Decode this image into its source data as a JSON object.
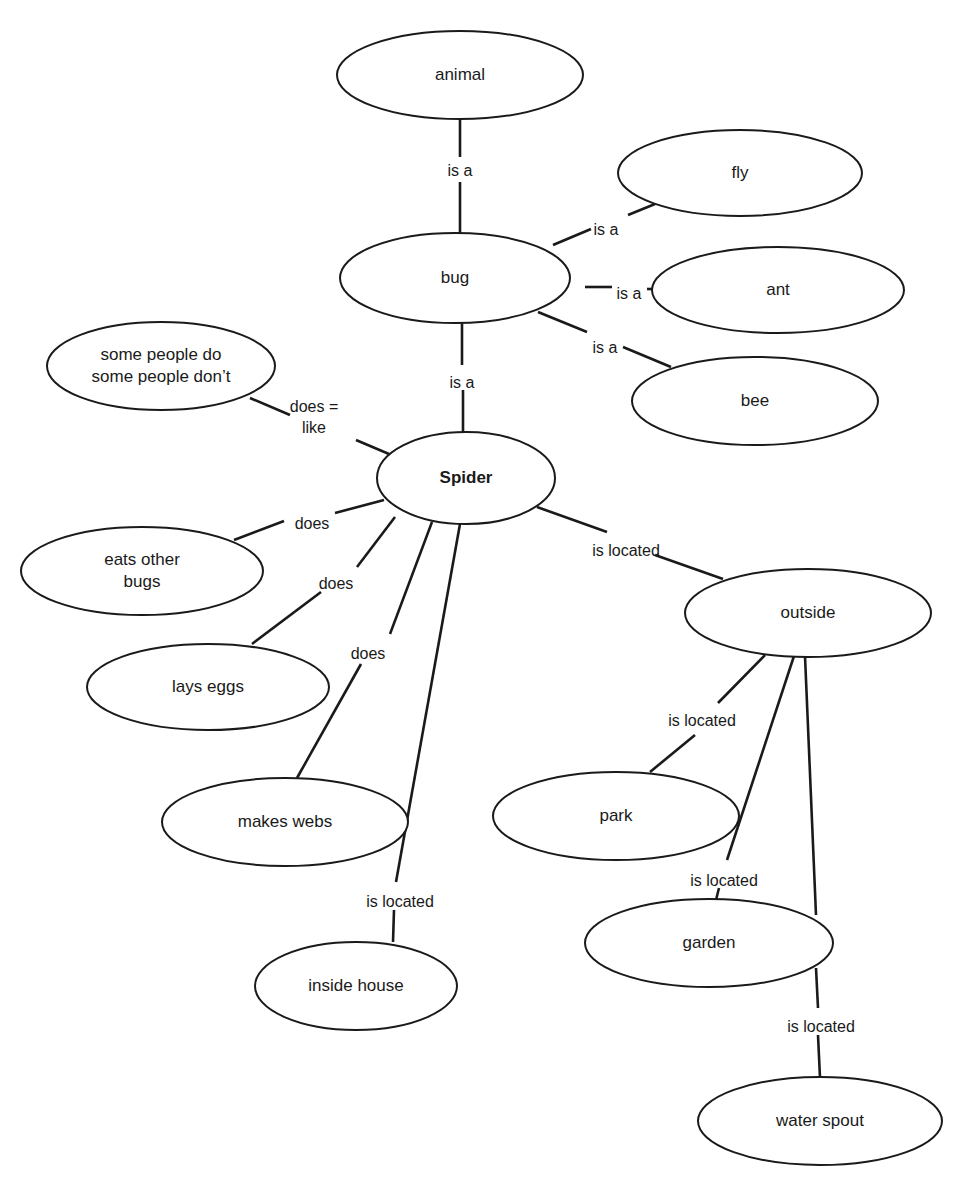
{
  "diagram": {
    "type": "concept-map",
    "colors": {
      "stroke": "#1a1a1a",
      "background": "#ffffff"
    },
    "nodes": [
      {
        "id": "animal",
        "label": [
          "animal"
        ],
        "cx": 460,
        "cy": 75,
        "rx": 123,
        "ry": 44
      },
      {
        "id": "fly",
        "label": [
          "fly"
        ],
        "cx": 740,
        "cy": 173,
        "rx": 122,
        "ry": 43
      },
      {
        "id": "bug",
        "label": [
          "bug"
        ],
        "cx": 455,
        "cy": 278,
        "rx": 115,
        "ry": 45
      },
      {
        "id": "ant",
        "label": [
          "ant"
        ],
        "cx": 778,
        "cy": 290,
        "rx": 126,
        "ry": 43
      },
      {
        "id": "bee",
        "label": [
          "bee"
        ],
        "cx": 755,
        "cy": 401,
        "rx": 123,
        "ry": 44
      },
      {
        "id": "some-people",
        "label": [
          "some people do",
          "some people don’t"
        ],
        "cx": 161,
        "cy": 366,
        "rx": 114,
        "ry": 44
      },
      {
        "id": "spider",
        "label": [
          "Spider"
        ],
        "bold": true,
        "cx": 466,
        "cy": 478,
        "rx": 89,
        "ry": 46
      },
      {
        "id": "eats-other-bugs",
        "label": [
          "eats other",
          "bugs"
        ],
        "cx": 142,
        "cy": 571,
        "rx": 121,
        "ry": 44
      },
      {
        "id": "outside",
        "label": [
          "outside"
        ],
        "cx": 808,
        "cy": 613,
        "rx": 123,
        "ry": 44
      },
      {
        "id": "lays-eggs",
        "label": [
          "lays eggs"
        ],
        "cx": 208,
        "cy": 687,
        "rx": 121,
        "ry": 43
      },
      {
        "id": "park",
        "label": [
          "park"
        ],
        "cx": 616,
        "cy": 816,
        "rx": 123,
        "ry": 44
      },
      {
        "id": "makes-webs",
        "label": [
          "makes webs"
        ],
        "cx": 285,
        "cy": 822,
        "rx": 123,
        "ry": 44
      },
      {
        "id": "garden",
        "label": [
          "garden"
        ],
        "cx": 709,
        "cy": 943,
        "rx": 124,
        "ry": 44
      },
      {
        "id": "inside-house",
        "label": [
          "inside house"
        ],
        "cx": 356,
        "cy": 986,
        "rx": 101,
        "ry": 44
      },
      {
        "id": "water-spout",
        "label": [
          "water spout"
        ],
        "cx": 820,
        "cy": 1121,
        "rx": 122,
        "ry": 44
      }
    ],
    "edges": [
      {
        "from": "animal",
        "to": "bug",
        "label": [
          "is a"
        ],
        "lx": 460,
        "ly": 172,
        "segs": [
          [
            460,
            119,
            460,
            157
          ],
          [
            460,
            182,
            460,
            233
          ]
        ]
      },
      {
        "from": "bug",
        "to": "fly",
        "label": [
          "is a"
        ],
        "lx": 606,
        "ly": 231,
        "segs": [
          [
            553,
            245,
            591,
            229
          ],
          [
            628,
            215,
            655,
            204
          ]
        ]
      },
      {
        "from": "bug",
        "to": "ant",
        "label": [
          "is a"
        ],
        "lx": 629,
        "ly": 295,
        "segs": [
          [
            585,
            287,
            612,
            287
          ],
          [
            647,
            289,
            674,
            289
          ]
        ]
      },
      {
        "from": "bug",
        "to": "bee",
        "label": [
          "is a"
        ],
        "lx": 605,
        "ly": 349,
        "segs": [
          [
            538,
            312,
            587,
            332
          ],
          [
            623,
            347,
            671,
            367
          ]
        ]
      },
      {
        "from": "bug",
        "to": "spider",
        "label": [
          "is a"
        ],
        "lx": 462,
        "ly": 384,
        "segs": [
          [
            462,
            323,
            462,
            365
          ],
          [
            463,
            390,
            463,
            432
          ]
        ]
      },
      {
        "from": "spider",
        "to": "some-people",
        "label": [
          "does =",
          "like"
        ],
        "lx": 314,
        "ly": 418,
        "segs": [
          [
            250,
            398,
            290,
            415
          ],
          [
            356,
            440,
            389,
            454
          ]
        ]
      },
      {
        "from": "spider",
        "to": "eats-other-bugs",
        "label": [
          "does"
        ],
        "lx": 312,
        "ly": 525,
        "segs": [
          [
            384,
            500,
            335,
            513
          ],
          [
            284,
            521,
            234,
            540
          ]
        ]
      },
      {
        "from": "spider",
        "to": "lays-eggs",
        "label": [
          "does"
        ],
        "lx": 336,
        "ly": 585,
        "segs": [
          [
            395,
            517,
            357,
            567
          ],
          [
            321,
            592,
            252,
            644
          ]
        ]
      },
      {
        "from": "spider",
        "to": "makes-webs",
        "label": [
          "does"
        ],
        "lx": 368,
        "ly": 655,
        "segs": [
          [
            432,
            522,
            390,
            634
          ],
          [
            361,
            664,
            297,
            778
          ]
        ]
      },
      {
        "from": "spider",
        "to": "inside-house",
        "label": [
          "is located"
        ],
        "lx": 400,
        "ly": 903,
        "segs": [
          [
            460,
            524,
            396,
            882
          ],
          [
            394,
            910,
            393,
            942
          ]
        ]
      },
      {
        "from": "spider",
        "to": "outside",
        "label": [
          "is located"
        ],
        "lx": 626,
        "ly": 552,
        "segs": [
          [
            537,
            507,
            607,
            532
          ],
          [
            655,
            555,
            723,
            579
          ]
        ]
      },
      {
        "from": "outside",
        "to": "park",
        "label": [
          "is located"
        ],
        "lx": 702,
        "ly": 722,
        "segs": [
          [
            765,
            655,
            718,
            703
          ],
          [
            695,
            735,
            650,
            772
          ]
        ]
      },
      {
        "from": "outside",
        "to": "garden",
        "label": [
          "is located"
        ],
        "lx": 724,
        "ly": 882,
        "segs": [
          [
            794,
            656,
            727,
            860
          ],
          [
            719,
            888,
            716,
            900
          ]
        ]
      },
      {
        "from": "outside",
        "to": "water-spout",
        "label": [
          "is located"
        ],
        "lx": 821,
        "ly": 1028,
        "segs": [
          [
            805,
            656,
            816,
            915
          ],
          [
            816,
            968,
            818,
            1008
          ],
          [
            818,
            1035,
            820,
            1078
          ]
        ]
      }
    ]
  }
}
